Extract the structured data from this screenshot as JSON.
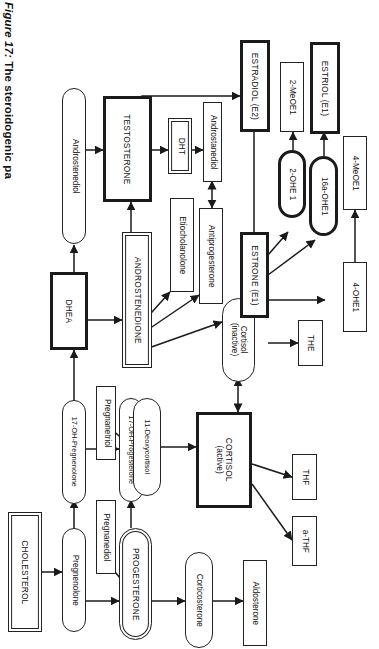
{
  "figure": {
    "label": "Figure 17:",
    "title": " The steroidogenic pa",
    "full_visible_title": "Figure 17: The steroidogenic pa"
  },
  "diagram": {
    "type": "flowchart",
    "orientation": "rotated-90-clockwise",
    "colors": {
      "ink": "#1a1a1a",
      "paper": "#ffffff",
      "emphasis_border": "#1b1b1b"
    },
    "nodes": [
      {
        "id": "cholesterol",
        "label": "CHOLESTEROL",
        "shape": "rect-double",
        "emphasis": "double"
      },
      {
        "id": "pregnenolone",
        "label": "Pregnenolone",
        "shape": "pill",
        "emphasis": "none"
      },
      {
        "id": "pregnanediol",
        "label": "Pregnanediol",
        "shape": "rect",
        "emphasis": "none"
      },
      {
        "id": "oh17-pregnenolone",
        "label": "17-OH-Pregnenolone",
        "shape": "pill",
        "emphasis": "none"
      },
      {
        "id": "pregnanetriol",
        "label": "Pregnanetriol",
        "shape": "rect",
        "emphasis": "none"
      },
      {
        "id": "progesterone",
        "label": "PROGESTERONE",
        "shape": "pill-double",
        "emphasis": "double"
      },
      {
        "id": "oh17-progesterone",
        "label": "17-OH-Progesterone",
        "shape": "pill",
        "emphasis": "none"
      },
      {
        "id": "corticosterone",
        "label": "Corticosterone",
        "shape": "pill",
        "emphasis": "none"
      },
      {
        "id": "aldosterone",
        "label": "Aldosterone",
        "shape": "rect",
        "emphasis": "none"
      },
      {
        "id": "deoxycortisol11",
        "label": "11-Deoxycortisol",
        "shape": "pill",
        "emphasis": "none"
      },
      {
        "id": "cortisol-active",
        "label": "CORTISOL\n(active)",
        "shape": "rect-thick",
        "emphasis": "thick"
      },
      {
        "id": "cortisol-inactive",
        "label": "Cortisol\n(inactive)",
        "shape": "pill",
        "emphasis": "none"
      },
      {
        "id": "the",
        "label": "THE",
        "shape": "rect",
        "emphasis": "none"
      },
      {
        "id": "thf",
        "label": "THF",
        "shape": "rect",
        "emphasis": "none"
      },
      {
        "id": "a-thf",
        "label": "a-THF",
        "shape": "rect",
        "emphasis": "none"
      },
      {
        "id": "dhea",
        "label": "DHEA",
        "shape": "rect-thick",
        "emphasis": "thick"
      },
      {
        "id": "androstenediol",
        "label": "Androstenediol",
        "shape": "pill",
        "emphasis": "none"
      },
      {
        "id": "androstenedione",
        "label": "ANDROSTENEDIONE",
        "shape": "rect-double",
        "emphasis": "double"
      },
      {
        "id": "etiocholanolone",
        "label": "Etiocholanolone",
        "shape": "rect",
        "emphasis": "none"
      },
      {
        "id": "antiprogesterone",
        "label": "Antiprogesterone",
        "shape": "rect",
        "emphasis": "none"
      },
      {
        "id": "testosterone",
        "label": "TESTOSTERONE",
        "shape": "rect-thick",
        "emphasis": "thick"
      },
      {
        "id": "dht",
        "label": "DHT",
        "shape": "rect-double",
        "emphasis": "double"
      },
      {
        "id": "androstanediol",
        "label": "Androstanediol",
        "shape": "rect",
        "emphasis": "none"
      },
      {
        "id": "estradiol-e2",
        "label": "ESTRADIOL (E2)",
        "shape": "rect-thick",
        "emphasis": "thick"
      },
      {
        "id": "estrone-e1",
        "label": "ESTRONE (E1)",
        "shape": "rect-thick",
        "emphasis": "thick"
      },
      {
        "id": "estriol-e1",
        "label": "ESTRIOL (E1)",
        "shape": "rect-thick",
        "emphasis": "thick"
      },
      {
        "id": "ohe1-2",
        "label": "2-OHE 1",
        "shape": "pill-thick",
        "emphasis": "thick"
      },
      {
        "id": "ohe1-16a",
        "label": "16a-OHE1",
        "shape": "pill-thick",
        "emphasis": "thick"
      },
      {
        "id": "meoe1-2",
        "label": "2-MeOE1",
        "shape": "rect",
        "emphasis": "none"
      },
      {
        "id": "ohe1-4",
        "label": "4-OHE1",
        "shape": "rect",
        "emphasis": "none"
      },
      {
        "id": "meoe1-4",
        "label": "4-MeOE1",
        "shape": "rect",
        "emphasis": "none"
      }
    ],
    "edges": [
      {
        "from": "cholesterol",
        "to": "pregnenolone",
        "arrow": "single"
      },
      {
        "from": "pregnenolone",
        "to": "oh17-pregnenolone",
        "arrow": "single"
      },
      {
        "from": "pregnenolone",
        "to": "progesterone",
        "arrow": "single"
      },
      {
        "from": "progesterone",
        "to": "pregnanediol",
        "arrow": "single"
      },
      {
        "from": "oh17-pregnenolone",
        "to": "oh17-progesterone",
        "arrow": "single"
      },
      {
        "from": "oh17-pregnenolone",
        "to": "dhea",
        "arrow": "single"
      },
      {
        "from": "oh17-progesterone",
        "to": "pregnanetriol",
        "arrow": "single"
      },
      {
        "from": "oh17-progesterone",
        "to": "deoxycortisol11",
        "arrow": "single"
      },
      {
        "from": "oh17-progesterone",
        "to": "androstenedione",
        "arrow": "single"
      },
      {
        "from": "progesterone",
        "to": "corticosterone",
        "arrow": "single"
      },
      {
        "from": "corticosterone",
        "to": "aldosterone",
        "arrow": "single"
      },
      {
        "from": "deoxycortisol11",
        "to": "cortisol-active",
        "arrow": "single"
      },
      {
        "from": "cortisol-active",
        "to": "cortisol-inactive",
        "arrow": "double"
      },
      {
        "from": "cortisol-inactive",
        "to": "the",
        "arrow": "single"
      },
      {
        "from": "cortisol-active",
        "to": "thf",
        "arrow": "single"
      },
      {
        "from": "cortisol-active",
        "to": "a-thf",
        "arrow": "single"
      },
      {
        "from": "dhea",
        "to": "androstenediol",
        "arrow": "single"
      },
      {
        "from": "dhea",
        "to": "androstenedione",
        "arrow": "single"
      },
      {
        "from": "androstenediol",
        "to": "testosterone",
        "arrow": "single"
      },
      {
        "from": "androstenedione",
        "to": "etiocholanolone",
        "arrow": "single"
      },
      {
        "from": "androstenedione",
        "to": "antiprogesterone",
        "arrow": "single"
      },
      {
        "from": "androstenedione",
        "to": "estrone-e1",
        "arrow": "single"
      },
      {
        "from": "androstenedione",
        "to": "testosterone",
        "arrow": "single"
      },
      {
        "from": "testosterone",
        "to": "dht",
        "arrow": "single"
      },
      {
        "from": "testosterone",
        "to": "estradiol-e2",
        "arrow": "single"
      },
      {
        "from": "dht",
        "to": "androstanediol",
        "arrow": "single"
      },
      {
        "from": "androstanediol",
        "to": "antiprogesterone",
        "arrow": "double"
      },
      {
        "from": "estradiol-e2",
        "to": "estrone-e1",
        "arrow": "double"
      },
      {
        "from": "estrone-e1",
        "to": "ohe1-2",
        "arrow": "single"
      },
      {
        "from": "estrone-e1",
        "to": "ohe1-16a",
        "arrow": "single"
      },
      {
        "from": "estrone-e1",
        "to": "ohe1-4",
        "arrow": "single"
      },
      {
        "from": "ohe1-2",
        "to": "meoe1-2",
        "arrow": "single"
      },
      {
        "from": "ohe1-16a",
        "to": "estriol-e1",
        "arrow": "single"
      },
      {
        "from": "ohe1-4",
        "to": "meoe1-4",
        "arrow": "single"
      }
    ]
  }
}
